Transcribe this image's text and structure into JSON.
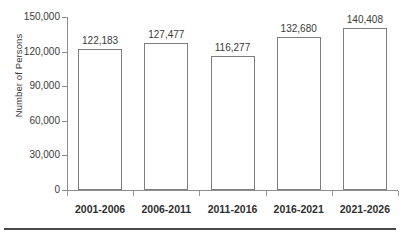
{
  "chart_data": {
    "type": "bar",
    "title": "",
    "xlabel": "",
    "ylabel": "Number of Persons",
    "categories": [
      "2001-2006",
      "2006-2011",
      "2011-2016",
      "2016-2021",
      "2021-2026"
    ],
    "values": [
      122183,
      127477,
      116277,
      132680,
      140408
    ],
    "value_labels": [
      "122,183",
      "127,477",
      "116,277",
      "132,680",
      "140,408"
    ],
    "ylim": [
      0,
      150000
    ],
    "ytick_values": [
      0,
      30000,
      60000,
      90000,
      120000,
      150000
    ],
    "ytick_labels": [
      "0",
      "30,000",
      "60,000",
      "90,000",
      "120,000",
      "150,000"
    ],
    "grid": false,
    "legend": null,
    "bar_fill_color": "#ffffff",
    "bar_edge_color": "#7d7d7d",
    "axis_color": "#8d8d8d",
    "text_color": "#3a3a3a"
  }
}
